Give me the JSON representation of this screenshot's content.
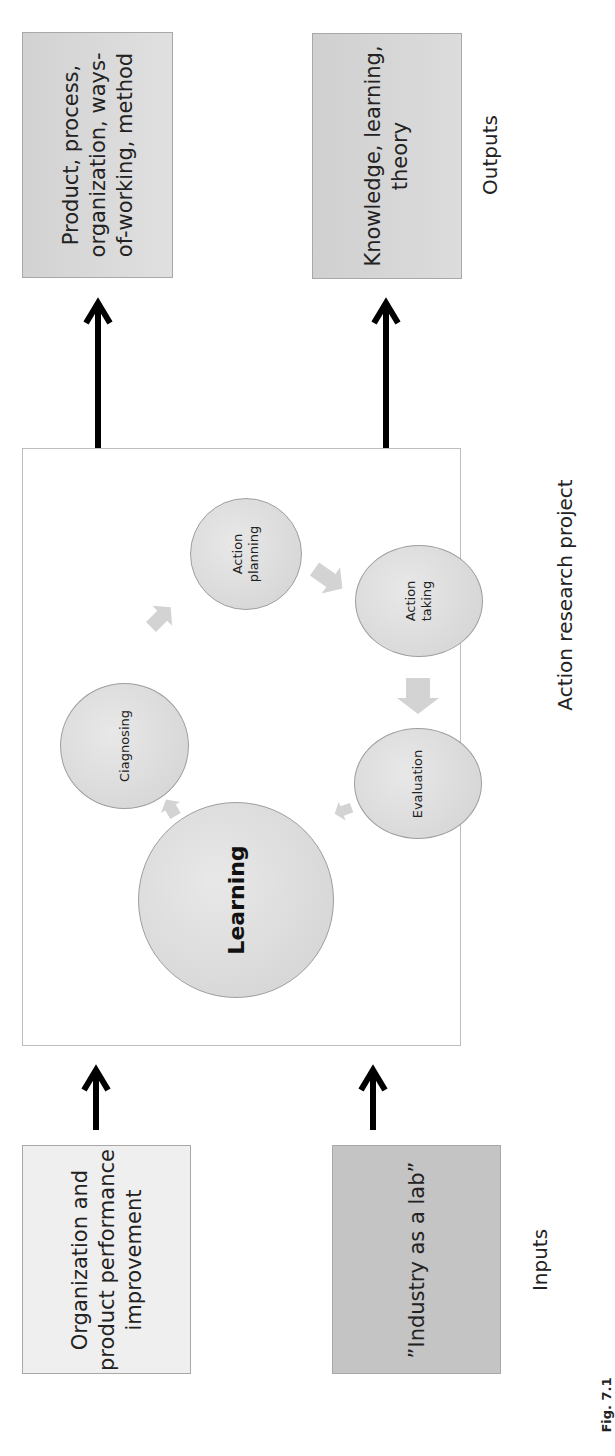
{
  "figure": {
    "orientation": "rotated -90deg (text reads bottom-to-top)",
    "caption": "Fig. 7.1",
    "colors": {
      "frame_border": "#bdbdbd",
      "circle_fill": "#d9d9d9",
      "cycle_arrow": "#cfcfcf",
      "flow_arrow": "#000000",
      "output_box_fill": "#d8d8d8",
      "input_box_1_fill": "#efefef",
      "input_box_2_fill": "#c4c4c4"
    }
  },
  "outputs": {
    "section_label": "Outputs",
    "boxes": [
      {
        "lines": [
          "Product, process,",
          "organization, ways-",
          "of-working, method"
        ]
      },
      {
        "lines": [
          "Knowledge, learning,",
          "theory"
        ]
      }
    ]
  },
  "project": {
    "section_label": "Action research project",
    "cycle": [
      {
        "id": "diagnosing",
        "lines": [
          "Ciagnosing"
        ]
      },
      {
        "id": "action-planning",
        "lines": [
          "Action",
          "planning"
        ]
      },
      {
        "id": "action-taking",
        "lines": [
          "Action",
          "taking"
        ]
      },
      {
        "id": "evaluation",
        "lines": [
          "Evaluation"
        ]
      }
    ],
    "center": {
      "id": "learning",
      "label": "Learning"
    }
  },
  "inputs": {
    "section_label": "Inputs",
    "boxes": [
      {
        "lines": [
          "Organization and",
          "product performance",
          "improvement"
        ]
      },
      {
        "lines": [
          "”Industry as a lab”"
        ]
      }
    ]
  }
}
